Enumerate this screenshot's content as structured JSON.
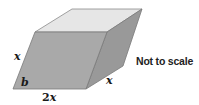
{
  "figure": {
    "type": "parallelepiped",
    "colors": {
      "top_face": "#e6e6e6",
      "front_face": "#a9a9a9",
      "right_face": "#999999",
      "edge": "#7a7a7a"
    },
    "labels": {
      "left_edge": "x",
      "angle": "b",
      "bottom_edge_coef": "2",
      "bottom_edge_var": "x",
      "depth_edge": "x"
    }
  },
  "note": "Not to scale"
}
